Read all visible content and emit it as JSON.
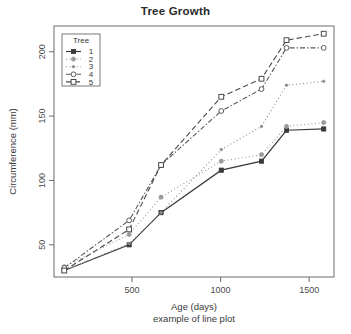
{
  "chart_data": {
    "type": "line",
    "title": "Tree Growth",
    "xlabel": "Age (days)",
    "sublabel": "example of line plot",
    "ylabel": "Circumference (mm)",
    "x": [
      118,
      484,
      664,
      1004,
      1231,
      1372,
      1582
    ],
    "xlim": [
      60,
      1640
    ],
    "ylim": [
      25,
      220
    ],
    "xticks": [
      500,
      1000,
      1500
    ],
    "yticks": [
      50,
      100,
      150,
      200
    ],
    "grid": false,
    "legend": {
      "title": "Tree",
      "position": "top-left",
      "entries": [
        {
          "label": "1",
          "symbol": "filled-square",
          "linetype": "solid"
        },
        {
          "label": "2",
          "symbol": "filled-circle",
          "linetype": "dotted"
        },
        {
          "label": "3",
          "symbol": "small-dot",
          "linetype": "dotted"
        },
        {
          "label": "4",
          "symbol": "open-circle",
          "linetype": "dash-dot"
        },
        {
          "label": "5",
          "symbol": "open-square",
          "linetype": "dashed"
        }
      ]
    },
    "series": [
      {
        "name": "1",
        "values": [
          30,
          50,
          75,
          108,
          115,
          139,
          140
        ]
      },
      {
        "name": "2",
        "values": [
          33,
          58,
          87,
          115,
          120,
          142,
          145
        ]
      },
      {
        "name": "3",
        "values": [
          30,
          51,
          75,
          124,
          142,
          174,
          177
        ]
      },
      {
        "name": "4",
        "values": [
          32,
          69,
          112,
          154,
          171,
          203,
          203
        ]
      },
      {
        "name": "5",
        "values": [
          30,
          62,
          112,
          165,
          179,
          209,
          214
        ]
      }
    ],
    "colors": {
      "axis": "#6b6b6b",
      "tree1": "#3a3a3a",
      "tree2": "#9a9a9a",
      "tree3": "#8a8a8a",
      "tree4": "#5a5a5a",
      "tree5": "#4a4a4a",
      "background": "#ffffff"
    }
  }
}
